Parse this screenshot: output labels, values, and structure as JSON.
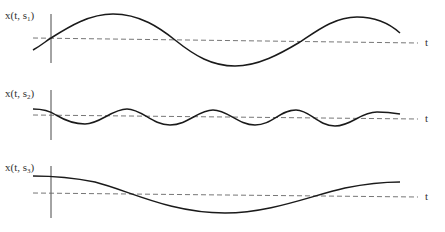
{
  "figure": {
    "panels": [
      {
        "id": "s1",
        "ylabel_main": "x(t, s",
        "ylabel_sub": "1",
        "ylabel_close": ")",
        "xlabel": "t",
        "description": "Large-amplitude, long-period oscillation"
      },
      {
        "id": "s2",
        "ylabel_main": "x(t, s",
        "ylabel_sub": "2",
        "ylabel_close": ")",
        "xlabel": "t",
        "description": "Small-amplitude, short-period oscillation"
      },
      {
        "id": "s3",
        "ylabel_main": "x(t, s",
        "ylabel_sub": "3",
        "ylabel_close": ")",
        "xlabel": "t",
        "description": "Very slow oscillation, single half-cycle trough"
      }
    ],
    "colors": {
      "curve": "#1a1a1a",
      "axis": "#333333",
      "baseline": "#666666",
      "background": "#ffffff"
    }
  }
}
